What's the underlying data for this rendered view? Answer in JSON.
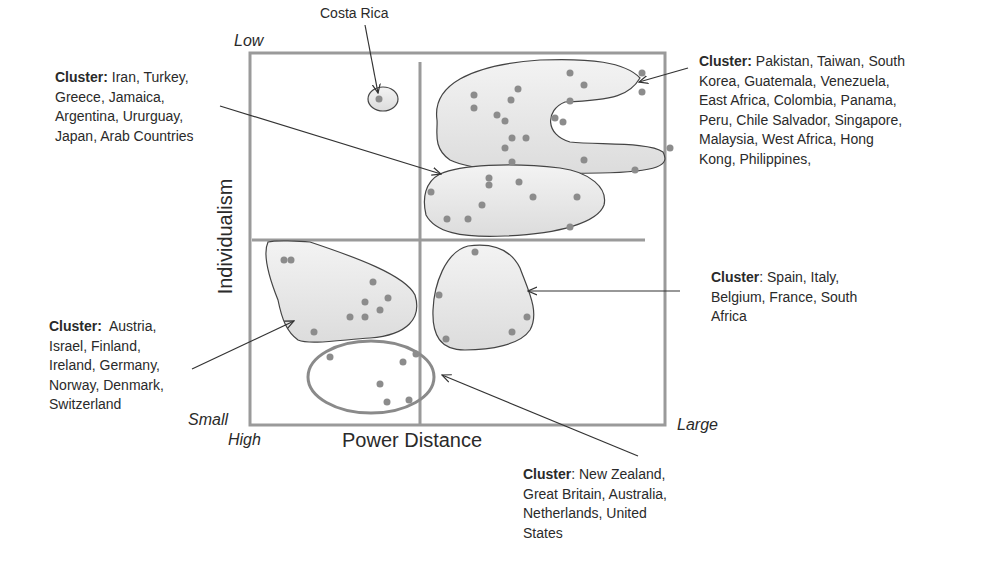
{
  "diagram": {
    "axes": {
      "x_title": "Power Distance",
      "y_title": "Individualism",
      "y_top": "Low",
      "y_bottom": "Small",
      "x_left": "High",
      "x_right": "Large"
    },
    "colors": {
      "frame": "#9a9a9a",
      "cluster_fill": "#e6e6e6",
      "cluster_stroke": "#444444",
      "dot": "#8c8c8c",
      "arrow": "#333333",
      "outline_only": "#8a8a8a"
    },
    "clusters": [
      {
        "id": "costa-rica",
        "prefix": "",
        "members": "Costa Rica"
      },
      {
        "id": "iran-cluster",
        "prefix": "Cluster:",
        "members": " Iran, Turkey, Greece, Jamaica, Argentina, Ururguay, Japan, Arab Countries",
        "lines": [
          "Iran, Turkey,",
          "Greece, Jamaica,",
          "Argentina, Ururguay,",
          "Japan, Arab Countries"
        ]
      },
      {
        "id": "pakistan-cluster",
        "prefix": "Cluster:",
        "lines": [
          "Pakistan, Taiwan, South",
          "Korea, Guatemala, Venezuela,",
          "East Africa, Colombia, Panama,",
          "Peru, Chile Salvador, Singapore,",
          "Malaysia, West Africa, Hong",
          "Kong, Philippines,"
        ]
      },
      {
        "id": "spain-cluster",
        "prefix": "Cluster",
        "lines": [
          ": Spain, Italy,",
          "Belgium, France, South",
          "Africa"
        ]
      },
      {
        "id": "austria-cluster",
        "prefix": "Cluster:",
        "lines": [
          "  Austria,",
          "Israel, Finland,",
          "Ireland, Germany,",
          "Norway, Denmark,",
          "Switzerland"
        ]
      },
      {
        "id": "anglo-cluster",
        "prefix": "Cluster",
        "lines": [
          ": New Zealand,",
          "Great Britain, Australia,",
          "Netherlands, United",
          "States"
        ]
      }
    ]
  }
}
